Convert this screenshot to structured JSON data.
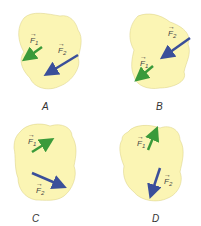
{
  "colors": {
    "blob_fill": "#fbf5b4",
    "blob_stroke": "#d8cf80",
    "f1_color": "#3a9a3a",
    "f2_color": "#3a4f9a",
    "label_color": "#444444"
  },
  "panels": [
    {
      "caption": "A",
      "f1_label": "F",
      "f1_sub": "1",
      "f2_label": "F",
      "f2_sub": "2"
    },
    {
      "caption": "B",
      "f1_label": "F",
      "f1_sub": "1",
      "f2_label": "F",
      "f2_sub": "2"
    },
    {
      "caption": "C",
      "f1_label": "F",
      "f1_sub": "1",
      "f2_label": "F",
      "f2_sub": "2"
    },
    {
      "caption": "D",
      "f1_label": "F",
      "f1_sub": "1",
      "f2_label": "F",
      "f2_sub": "2"
    }
  ]
}
